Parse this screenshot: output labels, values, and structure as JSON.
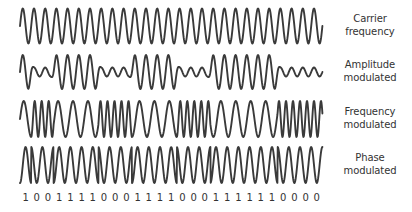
{
  "diagram": {
    "stroke_color": "#3a3a3a",
    "text_color": "#333333",
    "background": "#ffffff"
  },
  "rows": [
    {
      "id": "carrier",
      "label_line1": "Carrier",
      "label_line2": "frequency",
      "type": "carrier",
      "center_y": 26,
      "amplitude": 17.5,
      "label_top": 12
    },
    {
      "id": "am",
      "label_line1": "Amplitude",
      "label_line2": "modulated",
      "type": "am",
      "center_y": 72,
      "amplitude": 17,
      "low_amplitude": 4.5,
      "label_top": 58
    },
    {
      "id": "fm",
      "label_line1": "Frequency",
      "label_line2": "modulated",
      "type": "fm",
      "center_y": 119,
      "amplitude": 18,
      "label_top": 105
    },
    {
      "id": "pm",
      "label_line1": "Phase",
      "label_line2": "modulated",
      "type": "pm",
      "center_y": 165,
      "amplitude": 18,
      "label_top": 151
    }
  ],
  "bits": [
    1,
    0,
    0,
    1,
    1,
    1,
    1,
    0,
    0,
    0,
    1,
    1,
    1,
    1,
    0,
    0,
    0,
    1,
    1,
    1,
    1,
    1,
    1,
    0,
    0,
    0,
    0
  ],
  "bit_labels": [
    "1",
    "0",
    "0",
    "1",
    "1",
    "1",
    "1",
    "0",
    "0",
    "0",
    "1",
    "1",
    "1",
    "1",
    "0",
    "0",
    "0",
    "1",
    "1",
    "1",
    "1",
    "1",
    "1",
    "0",
    "0",
    "0",
    "0"
  ],
  "layout": {
    "wave_start_x": 20,
    "bit_period_px": 11.2,
    "label_center_x": 370
  }
}
